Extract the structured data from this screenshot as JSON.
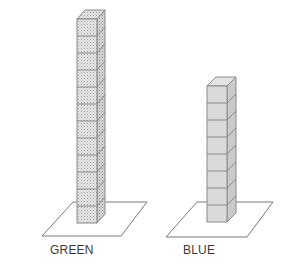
{
  "figure": {
    "type": "cube-tower-comparison",
    "towers": [
      {
        "label": "GREEN",
        "cube_count": 12,
        "fill_style": "stippled",
        "front_color": "#e6e6e6",
        "side_color": "#d4d4d4",
        "top_color": "#efefef",
        "stipple_color": "#9a9a9a",
        "edge_color": "#8a8a8a",
        "front_left": 77,
        "front_width": 20,
        "bottom_y": 223,
        "cube_height": 17,
        "depth_dx": 8,
        "depth_dy": 9,
        "plate": {
          "points": [
            [
              73,
              202
            ],
            [
              147,
              202
            ],
            [
              121,
              236
            ],
            [
              42,
              236
            ]
          ]
        },
        "label_x": 50,
        "label_y": 244
      },
      {
        "label": "BLUE",
        "cube_count": 8,
        "fill_style": "solid",
        "front_color": "#dadada",
        "side_color": "#cacaca",
        "top_color": "#e4e4e4",
        "stipple_color": "",
        "edge_color": "#8a8a8a",
        "front_left": 207,
        "front_width": 20,
        "bottom_y": 222,
        "cube_height": 17,
        "depth_dx": 9,
        "depth_dy": 9,
        "plate": {
          "points": [
            [
              197,
              202
            ],
            [
              273,
              202
            ],
            [
              247,
              237
            ],
            [
              166,
              237
            ]
          ]
        },
        "label_x": 183,
        "label_y": 244
      }
    ],
    "plate_stroke": "#7a7a7a",
    "background": "#ffffff"
  }
}
